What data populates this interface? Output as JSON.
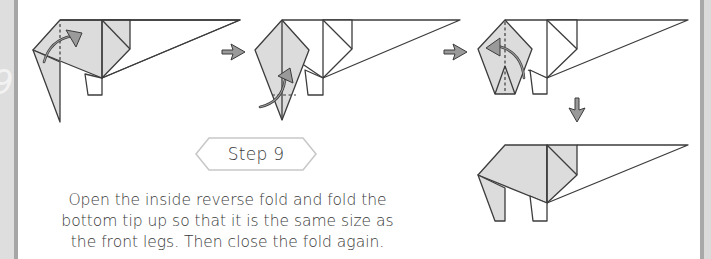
{
  "step": {
    "label": "Step 9",
    "number": 9
  },
  "instructions": {
    "lines": [
      "Open the inside reverse fold and fold the",
      "bottom tip up so that it is the same size as",
      "the front legs. Then close the fold again."
    ],
    "full_text": "Open the inside reverse fold and fold the bottom tip up so that it is the same size as the front legs. Then close the fold again."
  },
  "diagrams": [
    {
      "id": "diagram-1",
      "description": "Open the inside reverse fold",
      "arrows": [
        "curved-fold-arrow"
      ]
    },
    {
      "id": "diagram-2",
      "description": "Tip unfolded, fold bottom tip up",
      "arrows": [
        "curved-fold-arrow"
      ]
    },
    {
      "id": "diagram-3",
      "description": "Close the fold again",
      "arrows": [
        "curved-fold-arrow"
      ]
    },
    {
      "id": "diagram-4",
      "description": "Result with back leg sized like front legs",
      "arrows": []
    }
  ],
  "flow_arrows": [
    "right-arrow",
    "right-arrow",
    "down-arrow"
  ],
  "margin_glyph": "9",
  "colors": {
    "paper_fill": "#dcdcdc",
    "line": "#3c3c3c",
    "arrow_fill": "#9a9a9a",
    "badge_border": "#c8c8c8",
    "text": "#3a3a3a",
    "margin_panel": "#dedede",
    "margin_stripe": "#a6a6a6"
  }
}
